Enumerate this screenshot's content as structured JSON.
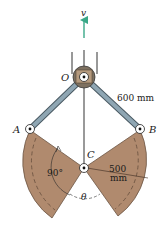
{
  "diagram": {
    "type": "mechanism",
    "labels": {
      "velocity": "v",
      "pivot_o": "O",
      "pin_a": "A",
      "pin_b": "B",
      "pin_c": "C",
      "link_length": "600 mm",
      "angle_sector": "90°",
      "radius_line1": "500",
      "radius_line2": "mm",
      "angle_theta": "θ"
    },
    "colors": {
      "sector_fill": "#b08a6e",
      "sector_edge": "#6b5443",
      "link_fill": "#8fa6b3",
      "link_edge": "#4a5a63",
      "arrow": "#3aa888",
      "hub_fill": "#8a7a66",
      "rod": "#555555"
    }
  }
}
